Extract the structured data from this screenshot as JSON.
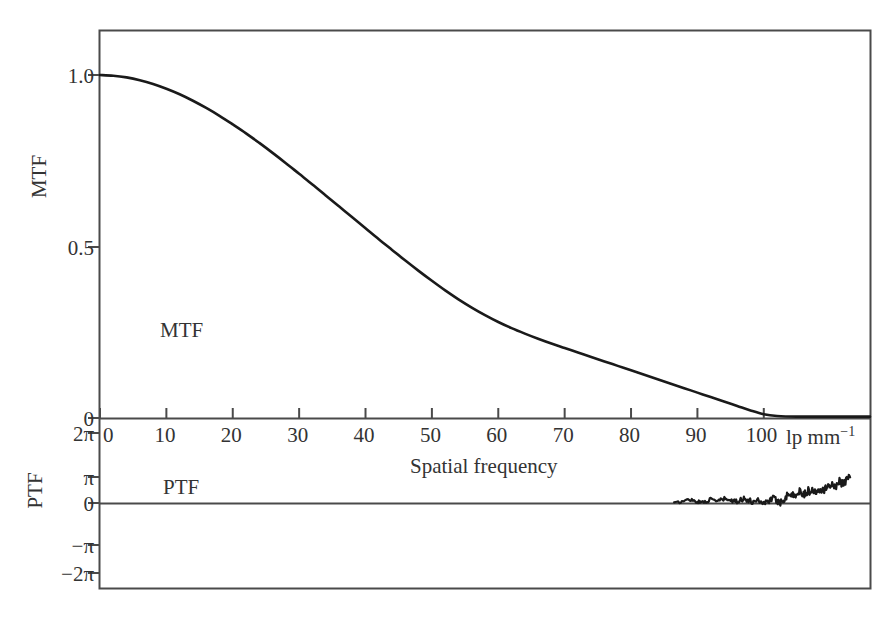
{
  "chart_data": {
    "type": "line",
    "title": "",
    "subtitle": "",
    "xlabel": "Spatial frequency",
    "xunits": "lp mm",
    "xunits_exponent": "−1",
    "xlim": [
      0,
      116
    ],
    "xticks": [
      0,
      10,
      20,
      30,
      40,
      50,
      60,
      70,
      80,
      90,
      100
    ],
    "xtick_labels": [
      "0",
      "10",
      "20",
      "30",
      "40",
      "50",
      "60",
      "70",
      "80",
      "90",
      "100"
    ],
    "grid": false,
    "legend": "none",
    "panels": [
      {
        "name": "MTF",
        "ylabel": "MTF",
        "annotation": "MTF",
        "ylim": [
          0,
          1.16
        ],
        "yticks": [
          0,
          0.5,
          1.0
        ],
        "ytick_labels": [
          "0",
          "0.5",
          "1.0"
        ],
        "series": [
          {
            "name": "MTF",
            "color": "#1a1a1a",
            "x": [
              0,
              2,
              4,
              6,
              8,
              10,
              12,
              14,
              16,
              18,
              20,
              22,
              24,
              26,
              28,
              30,
              32,
              34,
              36,
              38,
              40,
              42,
              44,
              46,
              48,
              50,
              52,
              54,
              56,
              58,
              60,
              62,
              64,
              66,
              68,
              70,
              72,
              74,
              76,
              78,
              80,
              82,
              84,
              86,
              88,
              90,
              92,
              94,
              96,
              98,
              100,
              102,
              105,
              110,
              116
            ],
            "values": [
              1.0,
              0.998,
              0.993,
              0.985,
              0.974,
              0.96,
              0.944,
              0.925,
              0.904,
              0.881,
              0.856,
              0.83,
              0.802,
              0.773,
              0.743,
              0.712,
              0.681,
              0.649,
              0.617,
              0.585,
              0.553,
              0.521,
              0.49,
              0.459,
              0.429,
              0.4,
              0.372,
              0.346,
              0.322,
              0.3,
              0.28,
              0.262,
              0.246,
              0.231,
              0.217,
              0.204,
              0.191,
              0.178,
              0.165,
              0.152,
              0.139,
              0.126,
              0.113,
              0.1,
              0.087,
              0.074,
              0.061,
              0.048,
              0.035,
              0.022,
              0.011,
              0.006,
              0.004,
              0.004,
              0.004
            ]
          }
        ]
      },
      {
        "name": "PTF",
        "ylabel": "PTF",
        "annotation": "PTF",
        "ylim": [
          -6.2832,
          6.2832
        ],
        "yticks": [
          6.2832,
          3.1416,
          0,
          -3.1416,
          -6.2832
        ],
        "ytick_labels": [
          "2π",
          "π",
          "0",
          "−π",
          "−2π"
        ],
        "series": [
          {
            "name": "PTF",
            "color": "#1a1a1a",
            "x": [
              86.5,
              87.5,
              88.3,
              89.0,
              89.8,
              90.5,
              91.3,
              92.0,
              92.8,
              93.5,
              94.2,
              95.0,
              95.7,
              96.4,
              97.0,
              97.7,
              98.3,
              99.0,
              99.6,
              100.2,
              100.8,
              101.4,
              102.0,
              102.5,
              103.0,
              103.5,
              104.0,
              104.5,
              105.0,
              105.5,
              106.0,
              106.5,
              107.0,
              107.5,
              108.0,
              108.5,
              109.0,
              109.5,
              110.0,
              110.5,
              111.0,
              111.5,
              112.0,
              112.5,
              113.0
            ],
            "values": [
              0.02,
              0.12,
              0.36,
              0.42,
              0.2,
              0.08,
              0.22,
              0.4,
              0.28,
              0.34,
              0.5,
              0.3,
              0.12,
              0.4,
              0.55,
              0.3,
              0.12,
              0.45,
              0.18,
              0.0,
              0.36,
              0.6,
              0.25,
              0.05,
              0.5,
              0.9,
              1.2,
              0.8,
              1.15,
              1.45,
              1.1,
              1.3,
              1.55,
              1.35,
              1.6,
              1.85,
              1.7,
              1.95,
              2.15,
              2.0,
              2.35,
              2.6,
              2.45,
              2.8,
              3.1
            ]
          }
        ]
      }
    ]
  },
  "axes": {
    "border_color": "#4a4a4a",
    "tick_color": "#4a4a4a"
  }
}
